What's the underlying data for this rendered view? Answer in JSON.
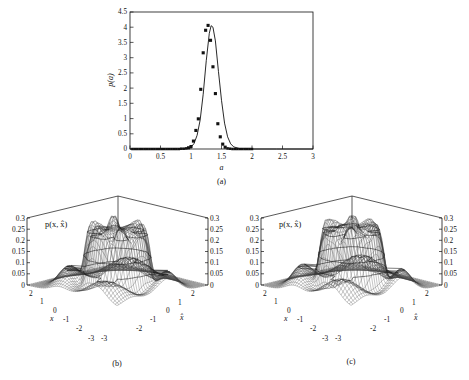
{
  "figure": {
    "panels": [
      "a",
      "b",
      "c"
    ],
    "captions": {
      "a": "(a)",
      "b": "(b)",
      "c": "(c)"
    }
  },
  "panel_a": {
    "caption": "(a)",
    "xlabel": "a",
    "ylabel": "p(a)",
    "xticks": [
      "0",
      "0.5",
      "1",
      "1.5",
      "2",
      "2.5",
      "3"
    ],
    "yticks": [
      "0",
      "0.5",
      "1",
      "1.5",
      "2",
      "2.5",
      "3",
      "3.5",
      "4",
      "4.5"
    ]
  },
  "panel_b": {
    "caption": "(b)",
    "zlabel": "p(x, x̂)",
    "xlabel_left": "x",
    "xlabel_right": "x̂",
    "zticks_left": [
      "0.3",
      "0.25",
      "0.2",
      "0.15",
      "0.1",
      "0.05",
      "0"
    ],
    "zticks_right": [
      "0.3",
      "0.25",
      "0.2",
      "0.15",
      "0.1",
      "0.05",
      "0"
    ],
    "xticks_left": [
      "2",
      "1",
      "0",
      "-1",
      "-2",
      "-3"
    ],
    "xticks_right": [
      "2",
      "1",
      "0",
      "-1",
      "-2",
      "-3"
    ],
    "corner_label_left": "-3",
    "corner_label_right": "-3"
  },
  "panel_c": {
    "caption": "(c)",
    "zlabel": "p(x, x̂)",
    "xlabel_left": "x",
    "xlabel_right": "x̂",
    "zticks_left": [
      "0.3",
      "0.25",
      "0.2",
      "0.15",
      "0.1",
      "0.05",
      "0"
    ],
    "zticks_right": [
      "0.3",
      "0.25",
      "0.2",
      "0.15",
      "0.1",
      "0.05",
      "0"
    ],
    "xticks_left": [
      "2",
      "1",
      "0",
      "-1",
      "-2",
      "-3"
    ],
    "xticks_right": [
      "2",
      "1",
      "0",
      "-1",
      "-2",
      "-3"
    ],
    "corner_label_left": "-3",
    "corner_label_right": "-3"
  },
  "chart_data": [
    {
      "type": "scatter",
      "panel": "a",
      "title": "",
      "xlabel": "a",
      "ylabel": "p(a)",
      "xlim": [
        0,
        3
      ],
      "ylim": [
        0,
        4.5
      ],
      "xticks": [
        0,
        0.5,
        1,
        1.5,
        2,
        2.5,
        3
      ],
      "yticks": [
        0,
        0.5,
        1,
        1.5,
        2,
        2.5,
        3,
        3.5,
        4,
        4.5
      ],
      "grid": false,
      "legend": "none",
      "series": [
        {
          "name": "p(a) samples",
          "marker": "filled-square",
          "x": [
            0.04,
            0.08,
            0.12,
            0.16,
            0.2,
            0.24,
            0.28,
            0.32,
            0.36,
            0.4,
            0.44,
            0.48,
            0.52,
            0.56,
            0.6,
            0.64,
            0.68,
            0.72,
            0.76,
            0.8,
            0.84,
            0.88,
            0.92,
            0.96,
            1.0,
            1.04,
            1.08,
            1.12,
            1.16,
            1.2,
            1.24,
            1.28,
            1.32,
            1.36,
            1.4,
            1.44,
            1.48,
            1.52,
            1.56,
            1.6,
            1.64,
            1.68,
            1.72,
            1.76,
            1.8,
            1.84,
            1.88,
            1.92,
            1.96,
            2.0
          ],
          "y": [
            0.0,
            0.0,
            0.0,
            0.0,
            0.0,
            0.0,
            0.0,
            0.0,
            0.0,
            0.0,
            0.0,
            0.0,
            0.0,
            0.0,
            0.0,
            0.0,
            0.0,
            0.0,
            0.0,
            0.0,
            0.01,
            0.01,
            0.02,
            0.04,
            0.08,
            0.26,
            0.61,
            0.99,
            1.96,
            3.16,
            3.9,
            4.06,
            3.57,
            2.7,
            1.82,
            0.83,
            0.4,
            0.16,
            0.06,
            0.02,
            0.01,
            0.0,
            0.0,
            0.0,
            0.0,
            0.0,
            0.0,
            0.0,
            0.0,
            0.0
          ]
        },
        {
          "name": "fitted curve",
          "marker": "line",
          "x": [
            0.0,
            0.2,
            0.4,
            0.6,
            0.8,
            0.9,
            1.0,
            1.05,
            1.1,
            1.15,
            1.2,
            1.25,
            1.3,
            1.33,
            1.36,
            1.4,
            1.45,
            1.5,
            1.55,
            1.6,
            1.65,
            1.7,
            1.8,
            2.0,
            2.4,
            3.0
          ],
          "y": [
            0.0,
            0.0,
            0.0,
            0.0,
            0.0,
            0.01,
            0.06,
            0.18,
            0.45,
            0.95,
            1.8,
            2.9,
            3.8,
            4.05,
            4.0,
            3.55,
            2.55,
            1.6,
            0.85,
            0.4,
            0.17,
            0.07,
            0.01,
            0.0,
            0.0,
            0.0
          ]
        }
      ]
    },
    {
      "type": "surface",
      "panel": "b",
      "title": "",
      "zlabel": "p(x, x̂)",
      "xlabel": "x",
      "ylabel": "x̂",
      "xlim": [
        -3,
        2
      ],
      "ylim": [
        -3,
        2
      ],
      "zlim": [
        0,
        0.3
      ],
      "zticks": [
        0,
        0.05,
        0.1,
        0.15,
        0.2,
        0.25,
        0.3
      ],
      "xticks": [
        -3,
        -2,
        -1,
        0,
        1,
        2
      ],
      "yticks": [
        -3,
        -2,
        -1,
        0,
        1,
        2
      ],
      "description": "Wireframe mesh joint density with a flat-topped mesa (plateau) near z=0.27 surrounded by oscillatory rim ripples and low skirt lobes near z=0.1",
      "plateau_level": 0.27,
      "skirt_level": 0.1,
      "grid": false,
      "legend": "none"
    },
    {
      "type": "surface",
      "panel": "c",
      "title": "",
      "zlabel": "p(x, x̂)",
      "xlabel": "x",
      "ylabel": "x̂",
      "xlim": [
        -3,
        2
      ],
      "ylim": [
        -3,
        2
      ],
      "zlim": [
        0,
        0.3
      ],
      "zticks": [
        0,
        0.05,
        0.1,
        0.15,
        0.2,
        0.25,
        0.3
      ],
      "xticks": [
        -3,
        -2,
        -1,
        0,
        1,
        2
      ],
      "yticks": [
        -3,
        -2,
        -1,
        0,
        1,
        2
      ],
      "description": "Wireframe mesh joint density with a flat-topped mesa (plateau) near z=0.28 with stronger rim oscillation than panel b and broader low skirt lobes",
      "plateau_level": 0.28,
      "skirt_level": 0.11,
      "grid": false,
      "legend": "none"
    }
  ],
  "colors": {
    "ink": "#111111",
    "mesh": "#3a3a3a",
    "background": "#ffffff"
  }
}
